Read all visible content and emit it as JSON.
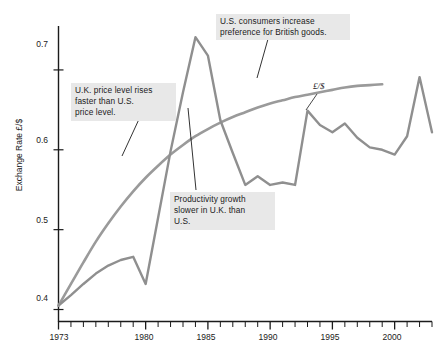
{
  "chart_data": {
    "type": "line",
    "title": "",
    "xlabel": "",
    "ylabel": "Exchange Rate £/$",
    "xlim": [
      1973,
      2003
    ],
    "ylim": [
      0.385,
      0.755
    ],
    "grid": false,
    "legend_position": "inline-annotation",
    "x_tick_labels": [
      "1973",
      "1980",
      "1985",
      "1990",
      "1995",
      "2000"
    ],
    "x_tick_values": [
      1973,
      1980,
      1985,
      1990,
      1995,
      2000
    ],
    "x_minor_ticks_every": 1,
    "y_tick_labels": [
      "0.4",
      "0.5",
      "0.6",
      "0.7"
    ],
    "y_tick_values": [
      0.4,
      0.5,
      0.6,
      0.7
    ],
    "series": [
      {
        "name": "£/$",
        "style": "jagged-line",
        "color": "#8f8f8f",
        "x": [
          1973,
          1974,
          1975,
          1976,
          1977,
          1978,
          1979,
          1980,
          1981,
          1982,
          1983,
          1984,
          1985,
          1986,
          1987,
          1988,
          1989,
          1990,
          1991,
          1992,
          1993,
          1994,
          1995,
          1996,
          1997,
          1998,
          1999,
          2000,
          2001,
          2002,
          2003
        ],
        "y": [
          0.405,
          0.418,
          0.432,
          0.445,
          0.455,
          0.462,
          0.466,
          0.432,
          0.515,
          0.598,
          0.672,
          0.741,
          0.718,
          0.637,
          0.596,
          0.556,
          0.567,
          0.556,
          0.559,
          0.556,
          0.649,
          0.631,
          0.622,
          0.633,
          0.615,
          0.603,
          0.6,
          0.594,
          0.617,
          0.691,
          0.622
        ]
      },
      {
        "name": "purchasing-power-parity",
        "style": "smooth-curve",
        "color": "#9a9a9a",
        "x": [
          1973,
          1974,
          1975,
          1976,
          1977,
          1978,
          1979,
          1980,
          1981,
          1982,
          1983,
          1984,
          1985,
          1986,
          1987,
          1988,
          1989,
          1990,
          1991,
          1992,
          1993,
          1994,
          1995,
          1996,
          1997,
          1998,
          1999
        ],
        "y": [
          0.405,
          0.432,
          0.459,
          0.485,
          0.508,
          0.529,
          0.548,
          0.565,
          0.58,
          0.594,
          0.606,
          0.617,
          0.626,
          0.634,
          0.641,
          0.647,
          0.653,
          0.658,
          0.662,
          0.666,
          0.669,
          0.672,
          0.675,
          0.678,
          0.68,
          0.681,
          0.682
        ]
      }
    ],
    "annotations": [
      {
        "id": "uk-price",
        "text": "U.K. price level rises\nfaster than U.S.\nprice level.",
        "pointer_to": "purchasing-power-parity"
      },
      {
        "id": "us-consumers",
        "text": "U.S. consumers increase\npreference for British goods.",
        "pointer_to": "purchasing-power-parity"
      },
      {
        "id": "productivity",
        "text": "Productivity growth\nslower in U.K. than\nU.S.",
        "pointer_to": "£/$"
      }
    ],
    "series_inline_label": "£/$"
  },
  "colors": {
    "line": "#8f8f8f",
    "curve": "#9a9a9a",
    "axis": "#1b1b1b",
    "annotation_bg": "#e8e8e8",
    "annotation_text": "#1b1b1b",
    "background": "#ffffff"
  }
}
